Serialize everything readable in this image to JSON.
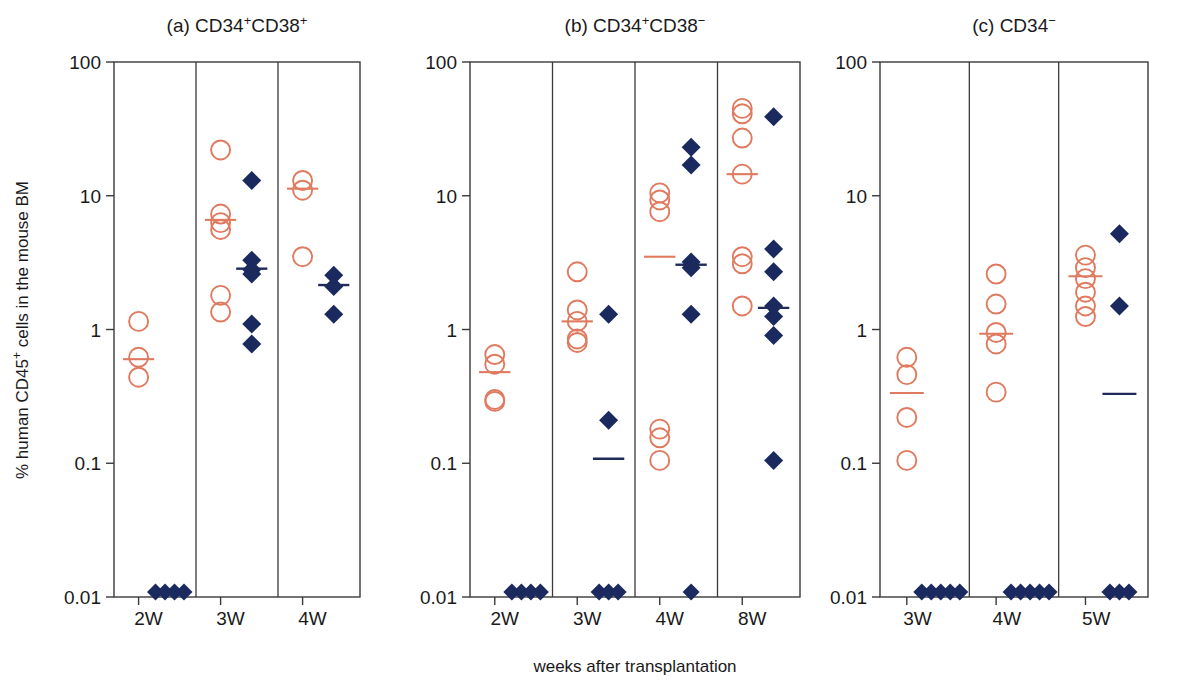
{
  "figure": {
    "ylabel": "% human CD45",
    "ylabel_sup": "+",
    "ylabel_tail": " cells in the mouse BM",
    "xlabel": "weeks after transplantation",
    "colors": {
      "circle": "#e07a5f",
      "diamond": "#1b2a5e",
      "axis": "#3a3a3a"
    },
    "y_ticks": [
      "100",
      "10",
      "1",
      "0.1",
      "0.01"
    ]
  },
  "chart_data": {
    "type": "scatter",
    "xlabel": "weeks after transplantation",
    "ylabel": "% human CD45+ cells in the mouse BM",
    "yscale": "log",
    "ylim": [
      0.01,
      100
    ],
    "ytick_values": [
      0.01,
      0.1,
      1,
      10,
      100
    ],
    "ytick_labels": [
      "0.01",
      "0.1",
      "1",
      "10",
      "100"
    ],
    "grid": false,
    "legend": "none",
    "series_names": [
      "open circle (salmon)",
      "filled diamond (navy)"
    ],
    "panels": [
      {
        "id": "a",
        "label": "(a)",
        "title_main": "CD34",
        "title_sup1": "+",
        "title_mid": "CD38",
        "title_sup2": "+",
        "title_plain": "(a) CD34+CD38+",
        "categories": [
          "2W",
          "3W",
          "4W"
        ],
        "groups": [
          {
            "category": "2W",
            "circles": [
              1.15,
              0.62,
              0.44
            ],
            "circles_median": 0.6,
            "diamonds": [
              0.011,
              0.011,
              0.011,
              0.011
            ],
            "diamonds_median": null
          },
          {
            "category": "3W",
            "circles": [
              22.0,
              7.3,
              6.3,
              5.6,
              1.8,
              1.35
            ],
            "circles_median": 6.6,
            "diamonds": [
              13.0,
              3.3,
              2.8,
              2.6,
              1.1,
              0.78
            ],
            "diamonds_median": 2.85
          },
          {
            "category": "4W",
            "circles": [
              13.0,
              11.0,
              3.5
            ],
            "circles_median": 11.3,
            "diamonds": [
              2.55,
              2.1,
              1.3
            ],
            "diamonds_median": 2.15
          }
        ]
      },
      {
        "id": "b",
        "label": "(b)",
        "title_main": "CD34",
        "title_sup1": "+",
        "title_mid": "CD38",
        "title_sup2": "−",
        "title_plain": "(b) CD34+CD38−",
        "categories": [
          "2W",
          "3W",
          "4W",
          "8W"
        ],
        "groups": [
          {
            "category": "2W",
            "circles": [
              0.65,
              0.55,
              0.3,
              0.29
            ],
            "circles_median": 0.48,
            "diamonds": [
              0.011,
              0.011,
              0.011,
              0.011
            ],
            "diamonds_median": null
          },
          {
            "category": "3W",
            "circles": [
              2.7,
              1.4,
              1.15,
              0.85,
              0.8
            ],
            "circles_median": 1.15,
            "diamonds": [
              1.3,
              0.21,
              0.011,
              0.011,
              0.011
            ],
            "diamonds_median": 0.108
          },
          {
            "category": "4W",
            "circles": [
              10.5,
              9.3,
              7.6,
              0.18,
              0.155,
              0.105
            ],
            "circles_median": 3.5,
            "diamonds": [
              23.0,
              17.0,
              3.2,
              2.9,
              1.3,
              0.011
            ],
            "diamonds_median": 3.05
          },
          {
            "category": "8W",
            "circles": [
              45.0,
              41.0,
              27.0,
              14.5,
              3.5,
              3.1,
              1.5
            ],
            "circles_median": 14.5,
            "diamonds": [
              39.0,
              4.0,
              2.7,
              1.5,
              1.25,
              0.9,
              0.105
            ],
            "diamonds_median": 1.45
          }
        ]
      },
      {
        "id": "c",
        "label": "(c)",
        "title_main": "CD34",
        "title_sup1": "−",
        "title_mid": "",
        "title_sup2": "",
        "title_plain": "(c) CD34−",
        "categories": [
          "3W",
          "4W",
          "5W"
        ],
        "groups": [
          {
            "category": "3W",
            "circles": [
              0.62,
              0.46,
              0.22,
              0.105
            ],
            "circles_median": 0.335,
            "diamonds": [
              0.011,
              0.011,
              0.011,
              0.011,
              0.011
            ],
            "diamonds_median": null
          },
          {
            "category": "4W",
            "circles": [
              2.6,
              1.55,
              0.95,
              0.78,
              0.34
            ],
            "circles_median": 0.93,
            "diamonds": [
              0.011,
              0.011,
              0.011,
              0.011,
              0.011
            ],
            "diamonds_median": null
          },
          {
            "category": "5W",
            "circles": [
              3.6,
              2.9,
              2.4,
              1.9,
              1.5,
              1.25
            ],
            "circles_median": 2.5,
            "diamonds": [
              5.2,
              1.5,
              0.011,
              0.011,
              0.011
            ],
            "diamonds_median": 0.33
          }
        ]
      }
    ]
  }
}
